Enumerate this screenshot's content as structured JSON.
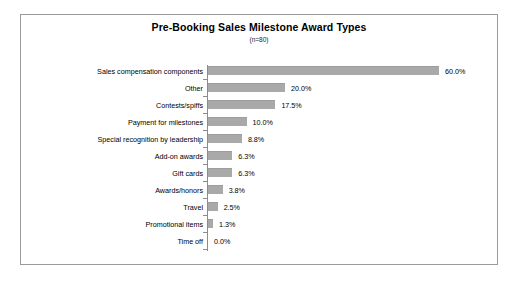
{
  "chart": {
    "title": "Pre-Booking Sales Milestone Award Types",
    "subtitle": "(n=80)",
    "bar_color": "#a9a9a9",
    "axis_color": "#8c8c8c",
    "border_color": "#9a9a9a",
    "background": "#ffffff"
  },
  "chart_data": {
    "type": "bar",
    "orientation": "horizontal",
    "title": "Pre-Booking Sales Milestone Award Types",
    "subtitle": "(n=80)",
    "xlabel": "",
    "ylabel": "",
    "xlim": [
      0,
      60
    ],
    "grid": false,
    "legend": false,
    "sample_size": 80,
    "categories": [
      "Sales compensation components",
      "Other",
      "Contests/spiffs",
      "Payment for milestones",
      "Special recognition by leadership",
      "Add-on awards",
      "Gift cards",
      "Awards/honors",
      "Travel",
      "Promotional items",
      "Time off"
    ],
    "values": [
      60.0,
      20.0,
      17.5,
      10.0,
      8.8,
      6.3,
      6.3,
      3.8,
      2.5,
      1.3,
      0.0
    ],
    "value_labels": [
      "60.0%",
      "20.0%",
      "17.5%",
      "10.0%",
      "8.8%",
      "6.3%",
      "6.3%",
      "3.8%",
      "2.5%",
      "1.3%",
      "0.0%"
    ]
  }
}
